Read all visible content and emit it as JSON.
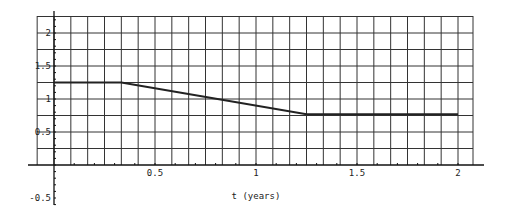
{
  "chart_data": {
    "type": "line",
    "title": "",
    "xlabel": "t (years)",
    "ylabel": "",
    "xlim": [
      -0.0833,
      2.0833
    ],
    "ylim": [
      -0.5,
      2.25
    ],
    "grid": true,
    "grid_x_step": 0.08333,
    "grid_y_step": 0.25,
    "x_ticks": [
      {
        "value": 0.5,
        "label": "0.5"
      },
      {
        "value": 1,
        "label": "1"
      },
      {
        "value": 1.5,
        "label": "1.5"
      },
      {
        "value": 2,
        "label": "2"
      }
    ],
    "y_ticks": [
      {
        "value": -0.5,
        "label": "-0.5"
      },
      {
        "value": 0.5,
        "label": "0.5"
      },
      {
        "value": 1,
        "label": "1"
      },
      {
        "value": 1.5,
        "label": "1.5"
      },
      {
        "value": 2,
        "label": "2"
      }
    ],
    "series": [
      {
        "name": "piecewise",
        "x": [
          0,
          0.3333,
          1.25,
          2
        ],
        "y": [
          1.25,
          1.25,
          0.77,
          0.77
        ]
      }
    ],
    "legend": null
  },
  "layout": {
    "origin_px": [
      54,
      165
    ],
    "x_scale_px_per_unit": 202,
    "y_scale_px_per_unit": 66,
    "grid_left_px": 37,
    "grid_right_px": 473,
    "grid_top_px": 16,
    "x_axis_end_px": 484,
    "y_axis_top_px": 11,
    "y_axis_bottom_px": 205,
    "curve_color": "#222222",
    "grid_color": "#333333"
  }
}
